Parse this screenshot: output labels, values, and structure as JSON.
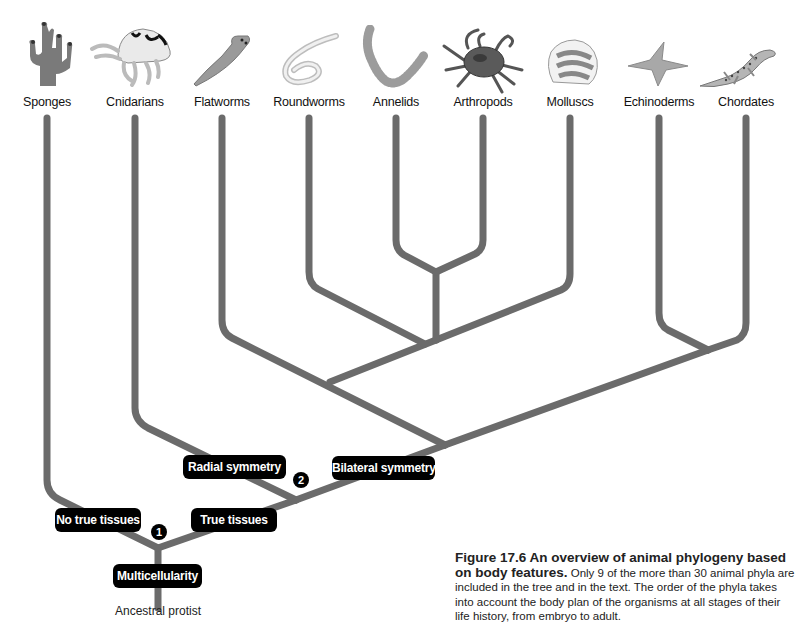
{
  "figure": {
    "number": "Figure 17.6",
    "title": "An overview of animal phylogeny based on body features.",
    "body": "Only 9 of the more than 30 animal phyla are included in the tree and in the text. The order of the phyla takes into account the body plan of the organisms at all stages of their life history, from embryo to adult."
  },
  "taxa": [
    {
      "label": "Sponges",
      "icon": "sponge-icon"
    },
    {
      "label": "Cnidarians",
      "icon": "jellyfish-icon"
    },
    {
      "label": "Flatworms",
      "icon": "flatworm-icon"
    },
    {
      "label": "Roundworms",
      "icon": "roundworm-icon"
    },
    {
      "label": "Annelids",
      "icon": "segmented-worm-icon"
    },
    {
      "label": "Arthropods",
      "icon": "crab-icon"
    },
    {
      "label": "Molluscs",
      "icon": "scallop-shell-icon"
    },
    {
      "label": "Echinoderms",
      "icon": "starfish-icon"
    },
    {
      "label": "Chordates",
      "icon": "lizard-icon"
    }
  ],
  "traits": {
    "no_true_tissues": "No true tissues",
    "true_tissues": "True tissues",
    "radial_symmetry": "Radial symmetry",
    "bilateral_symmetry": "Bilateral symmetry",
    "multicellularity": "Multicellularity"
  },
  "nodes": {
    "node1": "1",
    "node2": "2"
  },
  "root": {
    "label": "Ancestral protist"
  },
  "colors": {
    "branch": "#6b6b6b",
    "trait_box": "#000000",
    "trait_text": "#ffffff"
  }
}
